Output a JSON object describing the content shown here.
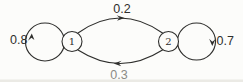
{
  "figure": {
    "type": "state-transition-diagram",
    "background_color": "#fcfcfa",
    "line_color": "#2e2e2c",
    "states": [
      {
        "id": "1",
        "label": "1"
      },
      {
        "id": "2",
        "label": "2"
      }
    ],
    "transitions": [
      {
        "from": "1",
        "to": "2",
        "probability": "0.2",
        "path": "top-arc"
      },
      {
        "from": "2",
        "to": "1",
        "probability": "0.3",
        "path": "bottom-arc"
      },
      {
        "from": "1",
        "to": "1",
        "probability": "0.8",
        "path": "left-self-loop"
      },
      {
        "from": "2",
        "to": "2",
        "probability": "0.7",
        "path": "right-self-loop"
      }
    ]
  }
}
